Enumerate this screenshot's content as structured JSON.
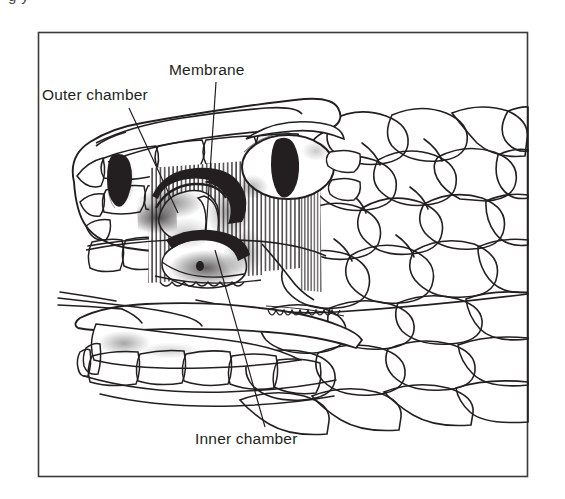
{
  "figure": {
    "kind": "scientific-line-illustration",
    "background_color": "#ffffff",
    "ink_color": "#231f20",
    "frame": {
      "name": "figure-border",
      "stroke_color": "#3a3a3a",
      "x": 38,
      "y": 32,
      "width": 490,
      "height": 445
    },
    "cut_off_caption": {
      "visible_fragment": "partial line of text cropped at top edge",
      "text": "g          y"
    }
  },
  "labels": [
    {
      "id": "outer-chamber",
      "text": "Outer chamber",
      "x": 42,
      "y": 100,
      "anchor": "start",
      "leader": {
        "x1": 129,
        "y1": 108,
        "x2": 178,
        "y2": 213
      }
    },
    {
      "id": "membrane",
      "text": "Membrane",
      "x": 169,
      "y": 75,
      "anchor": "start",
      "leader": {
        "x1": 216,
        "y1": 82,
        "x2": 206,
        "y2": 232
      }
    },
    {
      "id": "inner-chamber",
      "text": "Inner chamber",
      "x": 195,
      "y": 444,
      "anchor": "start",
      "leader": {
        "x1": 215,
        "y1": 250,
        "x2": 265,
        "y2": 427
      }
    }
  ],
  "anatomy": {
    "parts": [
      "head-outline",
      "eye-with-vertical-slit-pupil",
      "nostril",
      "facial-pit-organ",
      "pit-outer-chamber",
      "pit-membrane",
      "pit-inner-chamber",
      "head-scales",
      "body-scales",
      "upper-labial-scales",
      "lower-jaw",
      "lower-labial-scales",
      "forked-tongue"
    ]
  }
}
